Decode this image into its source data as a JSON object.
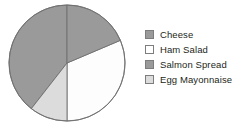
{
  "chart_data": {
    "type": "pie",
    "title": "",
    "subtitle": "",
    "xlabel": "",
    "ylabel": "",
    "grid": false,
    "legend_position": "right",
    "categories": [
      "Cheese",
      "Ham Salad",
      "Salmon Spread",
      "Egg Mayonnaise"
    ],
    "values": [
      37,
      31,
      19,
      13
    ],
    "units": "percent",
    "slices": [
      {
        "label": "Cheese",
        "value": 37,
        "color": "#9a9a9a",
        "start_angle_deg": 218,
        "end_angle_deg": 360,
        "swatch_color": "#9a9a9a",
        "swatch_border": "#7d7d7d"
      },
      {
        "label": "Ham Salad",
        "value": 31,
        "color": "#fdfdfd",
        "start_angle_deg": 67,
        "end_angle_deg": 180,
        "swatch_color": "#ffffff",
        "swatch_border": "#7d7d7d"
      },
      {
        "label": "Salmon Spread",
        "value": 19,
        "color": "#9a9a9a",
        "start_angle_deg": 0,
        "end_angle_deg": 67,
        "swatch_color": "#9a9a9a",
        "swatch_border": "#7d7d7d"
      },
      {
        "label": "Egg Mayonnaise",
        "value": 13,
        "color": "#dcdcdc",
        "start_angle_deg": 180,
        "end_angle_deg": 218,
        "swatch_color": "#dcdcdc",
        "swatch_border": "#7d7d7d"
      }
    ],
    "geometry": {
      "center_x": 59,
      "center_y": 60,
      "radius": 58,
      "outline_color": "#6f6f6f",
      "divider_color": "#6f6f6f"
    }
  },
  "legend": {
    "items": [
      {
        "label": "Cheese"
      },
      {
        "label": "Ham Salad"
      },
      {
        "label": "Salmon Spread"
      },
      {
        "label": "Egg Mayonnaise"
      }
    ]
  }
}
